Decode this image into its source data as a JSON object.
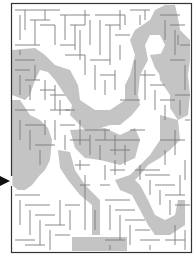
{
  "puzzle": {
    "title": "Rooster Maze",
    "type": "maze",
    "entrance": "left side, arrow pointing right",
    "colors": {
      "background": "#ffffff",
      "walls": "#7a7a7a",
      "border": "#333333",
      "silhouette": "#c4c4c4",
      "arrow": "#111111"
    }
  }
}
